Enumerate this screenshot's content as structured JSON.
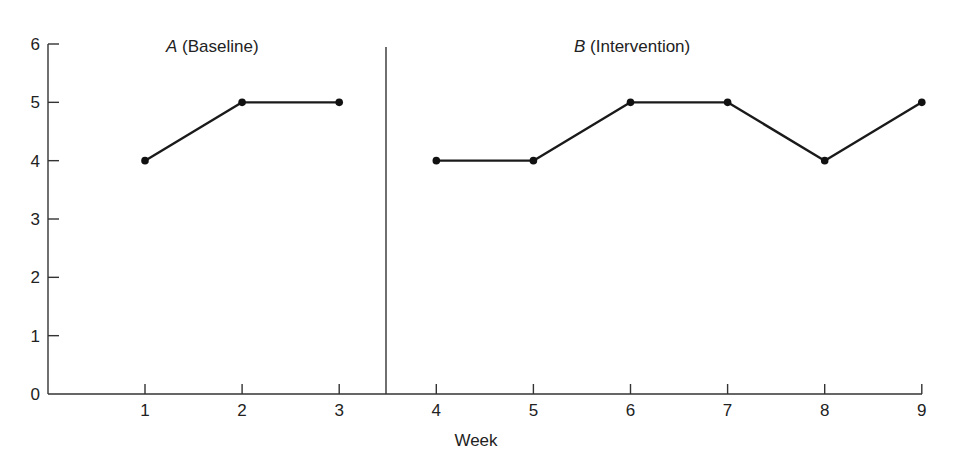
{
  "chart_data": {
    "type": "line",
    "title": "",
    "xlabel": "Week",
    "ylabel": "",
    "x": [
      1,
      2,
      3,
      4,
      5,
      6,
      7,
      8,
      9
    ],
    "xticks": [
      "1",
      "2",
      "3",
      "4",
      "5",
      "6",
      "7",
      "8",
      "9"
    ],
    "yticks": [
      "0",
      "1",
      "2",
      "3",
      "4",
      "5",
      "6"
    ],
    "ylim": [
      0,
      6
    ],
    "xlim": [
      0,
      9
    ],
    "grid": false,
    "legend": null,
    "phase_change_after_x": 3.5,
    "phases": [
      {
        "letter": "A",
        "name": "(Baseline)",
        "weeks": [
          1,
          2,
          3
        ],
        "values": [
          4,
          5,
          5
        ]
      },
      {
        "letter": "B",
        "name": "(Intervention)",
        "weeks": [
          4,
          5,
          6,
          7,
          8,
          9
        ],
        "values": [
          4,
          4,
          5,
          5,
          4,
          5
        ]
      }
    ],
    "series": [
      {
        "name": "A (Baseline)",
        "x": [
          1,
          2,
          3
        ],
        "values": [
          4,
          5,
          5
        ]
      },
      {
        "name": "B (Intervention)",
        "x": [
          4,
          5,
          6,
          7,
          8,
          9
        ],
        "values": [
          4,
          4,
          5,
          5,
          4,
          5
        ]
      }
    ]
  },
  "labels": {
    "phase_a_letter": "A",
    "phase_a_name": " (Baseline)",
    "phase_b_letter": "B",
    "phase_b_name": " (Intervention)",
    "x_axis_title": "Week"
  },
  "colors": {
    "line": "#1a1a1a",
    "axis": "#333333",
    "background": "#ffffff"
  }
}
